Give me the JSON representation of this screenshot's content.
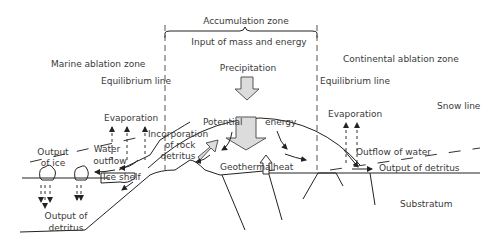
{
  "labels": {
    "accumulation_zone": "Accumulation zone",
    "input": "Input of mass and energy",
    "marine_ablation": "Marine ablation zone",
    "continental_ablation": "Continental ablation zone",
    "equilibrium_left": "Equilibrium line",
    "equilibrium_right": "Equilibrium line",
    "precipitation": "Precipitation",
    "snow_line": "Snow line",
    "evaporation_left": "Evaporation",
    "evaporation_right": "Evaporation",
    "potential": "Potential",
    "energy": "energy",
    "output_of_ice_1": "Output",
    "output_of_ice_2": "of ice",
    "water_outflow_1": "Water",
    "water_outflow_2": "outflow",
    "incorporation_1": "Incorporation",
    "incorporation_2": "of rock",
    "incorporation_3": "detritus",
    "ice_shelf": "Ice shelf",
    "geothermal": "Geothermal",
    "heat": "heat",
    "outflow_of_water": "Outflow of water",
    "output_of_detritus_right": "Output of detritus",
    "output_of_detritus_left_1": "Output of",
    "output_of_detritus_left_2": "detritus",
    "substratum": "Substratum"
  }
}
